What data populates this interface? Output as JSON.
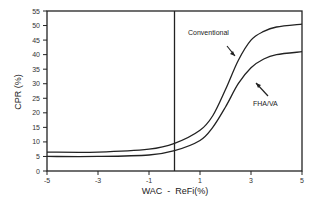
{
  "chart_data": {
    "type": "line",
    "title": "",
    "xlabel": "WAC  -  ReFi(%)",
    "ylabel": "CPR (%)",
    "xlim": [
      -5,
      5
    ],
    "ylim": [
      0,
      55
    ],
    "xticks": [
      -5,
      -3,
      -1,
      1,
      3,
      5
    ],
    "yticks": [
      0,
      5,
      10,
      15,
      20,
      25,
      30,
      35,
      40,
      45,
      50,
      55
    ],
    "grid": false,
    "reference_line": {
      "x": 0,
      "orientation": "vertical"
    },
    "series": [
      {
        "name": "Conventional",
        "x": [
          -5,
          -3,
          -1,
          0,
          1,
          1.5,
          2,
          2.5,
          3,
          3.5,
          4,
          5
        ],
        "values": [
          6.5,
          6.5,
          7.5,
          9.5,
          14,
          19,
          28,
          38,
          45,
          48,
          49.5,
          50.5
        ]
      },
      {
        "name": "FHA/VA",
        "x": [
          -5,
          -3,
          -1,
          0,
          1,
          1.5,
          2,
          2.5,
          3,
          3.5,
          4,
          5
        ],
        "values": [
          5,
          5,
          5.5,
          7,
          10.5,
          15,
          22,
          30,
          35.5,
          38.5,
          40,
          41
        ]
      }
    ],
    "annotations": [
      {
        "text": "Conventional",
        "arrow_to": "Conventional curve"
      },
      {
        "text": "FHA/VA",
        "arrow_to": "FHA/VA curve"
      }
    ]
  },
  "labels": {
    "xlabel": "WAC  -  ReFi(%)",
    "ylabel": "CPR  (%)",
    "conventional": "Conventional",
    "fha": "FHA/VA"
  }
}
